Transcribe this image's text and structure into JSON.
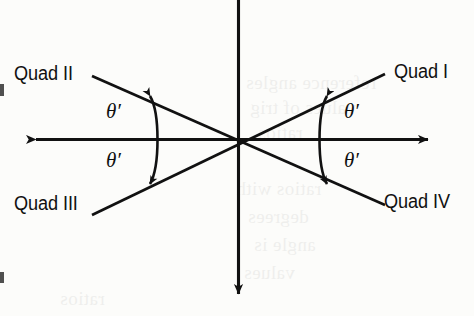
{
  "figure": {
    "type": "coordinate-axes-reference-angle-diagram",
    "width": 474,
    "height": 316,
    "background_color": "#fcfcfa",
    "ink_color": "#111111"
  },
  "labels": {
    "quad_1": "Quad I",
    "quad_2": "Quad II",
    "quad_3": "Quad III",
    "quad_4": "Quad IV"
  },
  "angles": {
    "theta_prime": "θ′",
    "q2_marker": "θ′",
    "q1_marker": "θ′",
    "q3_marker": "θ′",
    "q4_marker": "θ′"
  },
  "bleed_text": {
    "line_1": "reference angles",
    "line_2": "values of trig",
    "line_3": "ratios",
    "line_4": "ratios with",
    "line_5": "degrees",
    "line_6": "angle is",
    "line_7": "values"
  }
}
